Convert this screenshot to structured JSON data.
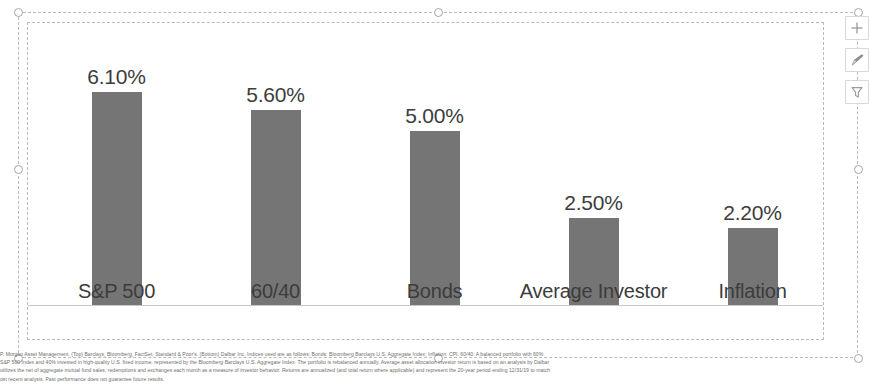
{
  "app": {
    "object_type": "selected-chart-object"
  },
  "chart_data": {
    "type": "bar",
    "title": "",
    "subtitle": "",
    "xlabel": "",
    "ylabel": "",
    "categories": [
      "S&P 500",
      "60/40",
      "Bonds",
      "Average Investor",
      "Inflation"
    ],
    "values": [
      6.1,
      5.6,
      5.0,
      2.5,
      2.2
    ],
    "value_labels": [
      "6.10%",
      "5.60%",
      "5.00%",
      "2.50%",
      "2.20%"
    ],
    "ylim": [
      0,
      7.05
    ],
    "grid": false,
    "legend": "none",
    "series": [
      {
        "name": "Annualized Return",
        "values": [
          6.1,
          5.6,
          5.0,
          2.5,
          2.2
        ],
        "color": "#757575"
      }
    ],
    "axis_line_color": "#c8c8c8"
  },
  "chart_buttons": [
    {
      "name": "chart-elements",
      "icon": "plus-icon",
      "label": "Chart Elements"
    },
    {
      "name": "chart-styles",
      "icon": "paintbrush-icon",
      "label": "Chart Styles"
    },
    {
      "name": "chart-filters",
      "icon": "funnel-icon",
      "label": "Chart Filters"
    }
  ],
  "footnote": {
    "lines": [
      "P. Morgan Asset Management. (Top) Barclays, Bloomberg, FactSet, Standard & Poor's. (Bottom) Dalbar Inc. Indices used are as follows: Bonds: Bloomberg Barclays U.S. Aggregate Index; Inflation: CPI. 60/40: A balanced portfolio with 60%",
      "S&P 500 Index and 40% invested in high-quality U.S. fixed income, represented by the Bloomberg Barclays U.S. Aggregate Index. The portfolio is rebalanced annually. Average asset allocation investor return is based on an analysis by Dalbar",
      "utilizes the net of aggregate mutual fund sales, redemptions and exchanges each month as a measure of investor behavior. Returns are annualized (and total return where applicable) and represent the 20-year period ending 12/31/19 to match",
      "ost recent analysis. Past performance does not guarantee future results."
    ]
  },
  "colors": {
    "bar": "#757575",
    "axis": "#c8c8c8",
    "selection_border": "#b9b9b9",
    "handle_border": "#a6a6a6",
    "text": "#3c3c3c",
    "footnote_text": "#6d6d6d"
  }
}
